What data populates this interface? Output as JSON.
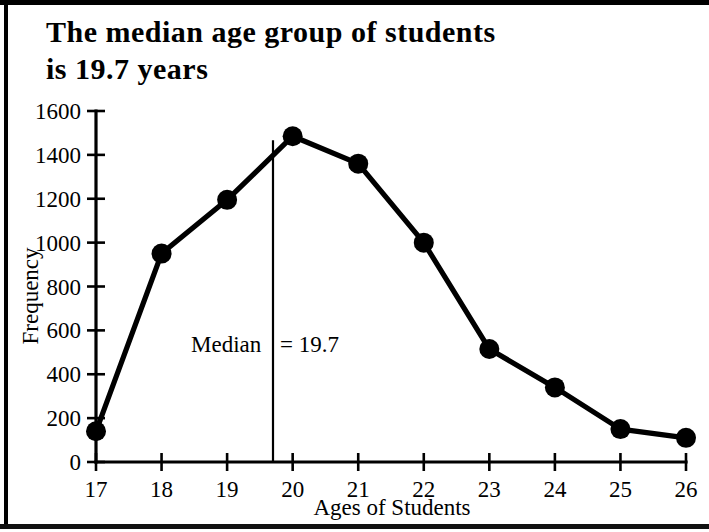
{
  "figure": {
    "title": "The median age group of students\nis 19.7 years",
    "border_color": "#000000",
    "ink_color": "#000000",
    "background": "#ffffff"
  },
  "chart_data": {
    "type": "line",
    "title": "The median age group of students is 19.7 years",
    "xlabel": "Ages of Students",
    "ylabel": "Frequency",
    "categories": [
      17,
      18,
      19,
      20,
      21,
      22,
      23,
      24,
      25,
      26
    ],
    "x": [
      17,
      18,
      19,
      20,
      21,
      22,
      23,
      24,
      25,
      26
    ],
    "values": [
      140,
      950,
      1195,
      1485,
      1360,
      1000,
      515,
      340,
      150,
      110
    ],
    "series": [
      {
        "name": "Frequency",
        "values": [
          140,
          950,
          1195,
          1485,
          1360,
          1000,
          515,
          340,
          150,
          110
        ]
      }
    ],
    "xlim": [
      17,
      26
    ],
    "ylim": [
      0,
      1600
    ],
    "xticks": [
      17,
      18,
      19,
      20,
      21,
      22,
      23,
      24,
      25,
      26
    ],
    "yticks": [
      0,
      200,
      400,
      600,
      800,
      1000,
      1200,
      1400,
      1600
    ],
    "xtick_labels": [
      "17",
      "18",
      "19",
      "20",
      "21",
      "22",
      "23",
      "24",
      "25",
      "26"
    ],
    "ytick_labels": [
      "0",
      "200",
      "400",
      "600",
      "800",
      "1000",
      "1200",
      "1400",
      "1600"
    ],
    "grid": false,
    "legend": null,
    "marker": "filled-circle",
    "marker_color": "#000000",
    "line_color": "#000000",
    "annotations": [
      {
        "name": "median-marker",
        "label": "Median = 19.7",
        "x": 19.7,
        "value": 19.7,
        "kind": "vertical-line-with-label"
      }
    ]
  },
  "axes": {
    "y_label": "Frequency",
    "x_label": "Ages of Students"
  },
  "annotation": {
    "median_label": "Median = 19.7"
  }
}
